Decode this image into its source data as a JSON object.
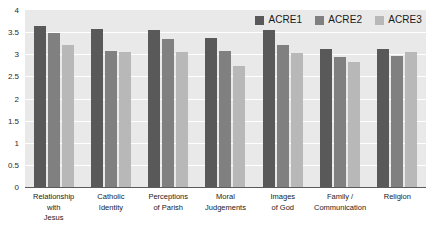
{
  "chart_data": {
    "type": "bar",
    "title": "",
    "subtitle": "",
    "xlabel": "",
    "ylabel": "",
    "ylim": [
      0,
      4
    ],
    "ytick_step": 0.5,
    "yticks": [
      "4",
      "3.5",
      "3",
      "2.5",
      "2",
      "1.5",
      "1",
      "0.5",
      "0"
    ],
    "grid": true,
    "legend_position": "top-right",
    "categories": [
      [
        "Relationship with",
        "Jesus"
      ],
      [
        "Catholic",
        "Identity"
      ],
      [
        "Perceptions",
        "of Parish"
      ],
      [
        "Moral",
        "Judgements"
      ],
      [
        "Images",
        "of God"
      ],
      [
        "Family /",
        "Communication"
      ],
      [
        "Religion"
      ]
    ],
    "series": [
      {
        "name": "ACRE1",
        "color": "#595959",
        "values": [
          3.65,
          3.57,
          3.54,
          3.37,
          3.55,
          3.13,
          3.12
        ]
      },
      {
        "name": "ACRE2",
        "color": "#808080",
        "values": [
          3.49,
          3.08,
          3.35,
          3.07,
          3.21,
          2.94,
          2.97
        ]
      },
      {
        "name": "ACRE3",
        "color": "#b8b8b8",
        "values": [
          3.22,
          3.06,
          3.05,
          2.74,
          3.02,
          2.83,
          3.05
        ]
      }
    ]
  },
  "style": {
    "plot_background": "#e9e9e9",
    "gridline_color": "#ffffff",
    "axis_color": "#5b5b5b",
    "text_color": "#1a1a1a"
  }
}
